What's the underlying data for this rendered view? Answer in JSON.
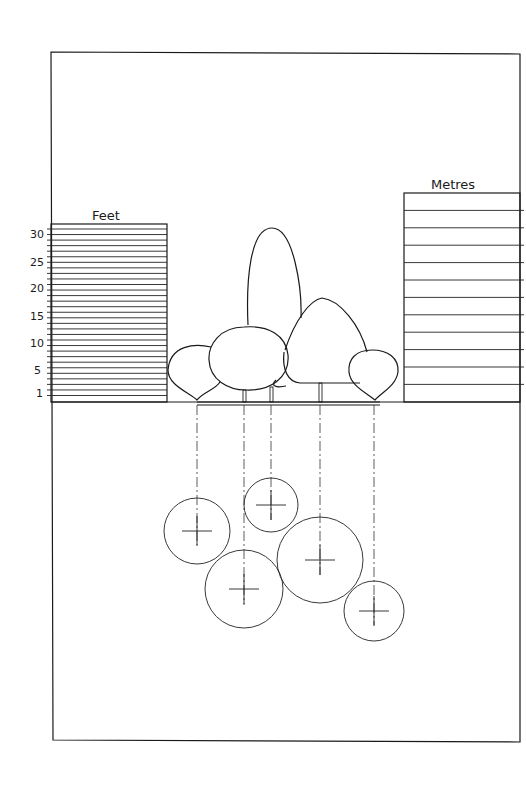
{
  "diagram": {
    "scales": {
      "feet": {
        "label": "Feet",
        "ticks": [
          "30",
          "25",
          "20",
          "15",
          "10",
          "5",
          "1"
        ]
      },
      "metres": {
        "label": "Metres"
      }
    },
    "elevation_trees": [
      "rounded-weeping-left",
      "round-large",
      "columnar-tall",
      "conical-broad",
      "rounded-weeping-right"
    ],
    "plan_circles": [
      {
        "name": "plan-circle-1",
        "cx": 197,
        "cy": 531,
        "r": 33
      },
      {
        "name": "plan-circle-2",
        "cx": 271,
        "cy": 505,
        "r": 27
      },
      {
        "name": "plan-circle-3",
        "cx": 244,
        "cy": 589,
        "r": 39
      },
      {
        "name": "plan-circle-4",
        "cx": 320,
        "cy": 560,
        "r": 43
      },
      {
        "name": "plan-circle-5",
        "cx": 374,
        "cy": 611,
        "r": 30
      }
    ]
  }
}
